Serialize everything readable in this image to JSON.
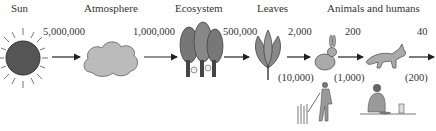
{
  "diagram": {
    "stages": [
      {
        "label": "Sun",
        "icon": "sun-icon"
      },
      {
        "label": "Atmosphere",
        "icon": "cloud-icon"
      },
      {
        "label": "Ecosystem",
        "icon": "forest-icon"
      },
      {
        "label": "Leaves",
        "icon": "leaves-icon"
      },
      {
        "label": "Animals and humans",
        "icon": "animals-icon"
      }
    ],
    "flows": [
      {
        "value": "5,000,000"
      },
      {
        "value": "1,000,000"
      },
      {
        "value": "500,000"
      },
      {
        "value": "2,000",
        "human_value": "(10,000)"
      },
      {
        "value": "200",
        "human_value": "(1,000)"
      },
      {
        "value": "40",
        "human_value": "(200)"
      }
    ]
  }
}
